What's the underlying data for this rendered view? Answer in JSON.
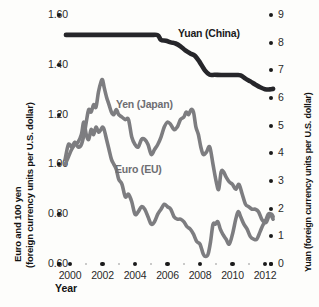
{
  "chart_data": {
    "type": "line",
    "title": "",
    "xlabel": "Year",
    "ylabel_left_line1": "Euro and 100 yen",
    "ylabel_left_line2": "(foreign currency units per U.S. dollar)",
    "ylabel_right": "Yuan (foreign currency units per U.S. dollar)",
    "xlim": [
      1999.3,
      2012.6
    ],
    "xticks": [
      2000,
      2002,
      2004,
      2006,
      2008,
      2010,
      2012
    ],
    "xticklabels": [
      "2000",
      "2002",
      "2004",
      "2006",
      "2008",
      "2010",
      "2012"
    ],
    "xminor": [
      2001,
      2003,
      2005,
      2007,
      2009,
      2011
    ],
    "ylim_left": [
      0.6,
      1.6
    ],
    "yticks_left": [
      1.6,
      1.4,
      1.2,
      1.0,
      0.8,
      0.6
    ],
    "yticklabels_left": [
      "1.60",
      "1.40",
      "1.20",
      "1.00",
      "0.80",
      "0.60"
    ],
    "ylim_right": [
      0,
      9
    ],
    "yticks_right": [
      9,
      8,
      7,
      6,
      5,
      4,
      3,
      2,
      1,
      0
    ],
    "yticklabels_right": [
      "9",
      "8",
      "7",
      "6",
      "5",
      "4",
      "3",
      "2",
      "1",
      "0"
    ],
    "grid": false,
    "legend_position": "inline-annotations",
    "colors": {
      "yuan": "#26262a",
      "yen": "#7d7d80",
      "euro": "#7d7d80",
      "tick": "#1a1a1a",
      "minor_tick": "#b9b9b9",
      "background": "#fdfdfb"
    },
    "series": [
      {
        "name": "Yuan (China)",
        "axis": "right",
        "color": "#26262a",
        "label_x": 2006.1,
        "label_y": 8.1,
        "points": [
          [
            1999.75,
            8.28
          ],
          [
            2000.5,
            8.28
          ],
          [
            2001.5,
            8.28
          ],
          [
            2002.5,
            8.28
          ],
          [
            2003.5,
            8.28
          ],
          [
            2004.5,
            8.28
          ],
          [
            2005.0,
            8.28
          ],
          [
            2005.4,
            8.27
          ],
          [
            2005.6,
            8.1
          ],
          [
            2005.9,
            8.07
          ],
          [
            2006.2,
            8.01
          ],
          [
            2006.5,
            7.97
          ],
          [
            2006.8,
            7.87
          ],
          [
            2007.1,
            7.72
          ],
          [
            2007.4,
            7.61
          ],
          [
            2007.7,
            7.52
          ],
          [
            2008.0,
            7.28
          ],
          [
            2008.3,
            7.0
          ],
          [
            2008.6,
            6.84
          ],
          [
            2008.9,
            6.84
          ],
          [
            2009.3,
            6.83
          ],
          [
            2009.8,
            6.83
          ],
          [
            2010.2,
            6.83
          ],
          [
            2010.5,
            6.82
          ],
          [
            2010.8,
            6.7
          ],
          [
            2011.1,
            6.6
          ],
          [
            2011.4,
            6.49
          ],
          [
            2011.7,
            6.39
          ],
          [
            2012.0,
            6.32
          ],
          [
            2012.3,
            6.31
          ],
          [
            2012.5,
            6.33
          ]
        ]
      },
      {
        "name": "Yen (Japan)",
        "axis": "left",
        "unit": "100 yen per U.S. dollar",
        "color": "#7d7d80",
        "label_x": 2002.9,
        "label_y": 1.24,
        "points": [
          [
            1999.7,
            1.02
          ],
          [
            1999.9,
            1.08
          ],
          [
            2000.1,
            1.07
          ],
          [
            2000.3,
            1.09
          ],
          [
            2000.5,
            1.07
          ],
          [
            2000.7,
            1.08
          ],
          [
            2000.9,
            1.13
          ],
          [
            2001.0,
            1.17
          ],
          [
            2001.15,
            1.22
          ],
          [
            2001.3,
            1.21
          ],
          [
            2001.45,
            1.24
          ],
          [
            2001.6,
            1.23
          ],
          [
            2001.75,
            1.29
          ],
          [
            2001.9,
            1.33
          ],
          [
            2002.0,
            1.34
          ],
          [
            2002.1,
            1.31
          ],
          [
            2002.25,
            1.27
          ],
          [
            2002.4,
            1.24
          ],
          [
            2002.55,
            1.21
          ],
          [
            2002.7,
            1.2
          ],
          [
            2002.85,
            1.22
          ],
          [
            2003.0,
            1.2
          ],
          [
            2003.2,
            1.19
          ],
          [
            2003.4,
            1.18
          ],
          [
            2003.6,
            1.18
          ],
          [
            2003.8,
            1.11
          ],
          [
            2004.0,
            1.08
          ],
          [
            2004.2,
            1.07
          ],
          [
            2004.4,
            1.1
          ],
          [
            2004.6,
            1.1
          ],
          [
            2004.8,
            1.08
          ],
          [
            2005.0,
            1.04
          ],
          [
            2005.2,
            1.06
          ],
          [
            2005.4,
            1.08
          ],
          [
            2005.6,
            1.11
          ],
          [
            2005.8,
            1.15
          ],
          [
            2006.0,
            1.17
          ],
          [
            2006.2,
            1.16
          ],
          [
            2006.4,
            1.14
          ],
          [
            2006.6,
            1.15
          ],
          [
            2006.8,
            1.18
          ],
          [
            2007.0,
            1.19
          ],
          [
            2007.15,
            1.21
          ],
          [
            2007.3,
            1.2
          ],
          [
            2007.45,
            1.22
          ],
          [
            2007.6,
            1.21
          ],
          [
            2007.75,
            1.15
          ],
          [
            2007.9,
            1.12
          ],
          [
            2008.05,
            1.07
          ],
          [
            2008.2,
            1.04
          ],
          [
            2008.4,
            1.05
          ],
          [
            2008.6,
            1.07
          ],
          [
            2008.8,
            1.0
          ],
          [
            2009.0,
            0.93
          ],
          [
            2009.15,
            0.9
          ],
          [
            2009.3,
            0.97
          ],
          [
            2009.45,
            0.97
          ],
          [
            2009.6,
            0.95
          ],
          [
            2009.8,
            0.93
          ],
          [
            2010.0,
            0.92
          ],
          [
            2010.2,
            0.9
          ],
          [
            2010.4,
            0.92
          ],
          [
            2010.6,
            0.88
          ],
          [
            2010.8,
            0.84
          ],
          [
            2011.0,
            0.83
          ],
          [
            2011.2,
            0.82
          ],
          [
            2011.4,
            0.82
          ],
          [
            2011.6,
            0.81
          ],
          [
            2011.8,
            0.78
          ],
          [
            2012.0,
            0.77
          ],
          [
            2012.2,
            0.8
          ],
          [
            2012.4,
            0.8
          ],
          [
            2012.5,
            0.79
          ]
        ]
      },
      {
        "name": "Euro (EU)",
        "axis": "left",
        "unit": "euros per U.S. dollar",
        "color": "#7d7d80",
        "label_x": 2002.85,
        "label_y": 0.97,
        "points": [
          [
            1999.7,
            1.0
          ],
          [
            1999.9,
            1.03
          ],
          [
            2000.1,
            1.06
          ],
          [
            2000.3,
            1.08
          ],
          [
            2000.5,
            1.09
          ],
          [
            2000.7,
            1.12
          ],
          [
            2000.85,
            1.17
          ],
          [
            2001.0,
            1.12
          ],
          [
            2001.15,
            1.1
          ],
          [
            2001.3,
            1.14
          ],
          [
            2001.45,
            1.12
          ],
          [
            2001.6,
            1.15
          ],
          [
            2001.75,
            1.13
          ],
          [
            2001.9,
            1.14
          ],
          [
            2002.0,
            1.15
          ],
          [
            2002.1,
            1.14
          ],
          [
            2002.25,
            1.1
          ],
          [
            2002.4,
            1.06
          ],
          [
            2002.55,
            1.02
          ],
          [
            2002.7,
            1.0
          ],
          [
            2002.85,
            0.98
          ],
          [
            2003.0,
            0.94
          ],
          [
            2003.2,
            0.92
          ],
          [
            2003.4,
            0.87
          ],
          [
            2003.6,
            0.88
          ],
          [
            2003.8,
            0.85
          ],
          [
            2004.0,
            0.8
          ],
          [
            2004.2,
            0.81
          ],
          [
            2004.4,
            0.83
          ],
          [
            2004.6,
            0.82
          ],
          [
            2004.8,
            0.79
          ],
          [
            2005.0,
            0.76
          ],
          [
            2005.2,
            0.77
          ],
          [
            2005.4,
            0.8
          ],
          [
            2005.6,
            0.82
          ],
          [
            2005.8,
            0.84
          ],
          [
            2006.0,
            0.83
          ],
          [
            2006.2,
            0.82
          ],
          [
            2006.4,
            0.79
          ],
          [
            2006.6,
            0.78
          ],
          [
            2006.8,
            0.78
          ],
          [
            2007.0,
            0.77
          ],
          [
            2007.2,
            0.75
          ],
          [
            2007.4,
            0.74
          ],
          [
            2007.6,
            0.72
          ],
          [
            2007.8,
            0.69
          ],
          [
            2008.0,
            0.68
          ],
          [
            2008.2,
            0.64
          ],
          [
            2008.35,
            0.63
          ],
          [
            2008.5,
            0.64
          ],
          [
            2008.65,
            0.69
          ],
          [
            2008.8,
            0.76
          ],
          [
            2008.95,
            0.76
          ],
          [
            2009.1,
            0.77
          ],
          [
            2009.25,
            0.74
          ],
          [
            2009.4,
            0.72
          ],
          [
            2009.6,
            0.7
          ],
          [
            2009.8,
            0.68
          ],
          [
            2010.0,
            0.72
          ],
          [
            2010.2,
            0.78
          ],
          [
            2010.35,
            0.81
          ],
          [
            2010.5,
            0.79
          ],
          [
            2010.7,
            0.76
          ],
          [
            2010.9,
            0.74
          ],
          [
            2011.1,
            0.71
          ],
          [
            2011.3,
            0.7
          ],
          [
            2011.5,
            0.7
          ],
          [
            2011.7,
            0.73
          ],
          [
            2011.9,
            0.76
          ],
          [
            2012.1,
            0.77
          ],
          [
            2012.3,
            0.8
          ],
          [
            2012.5,
            0.78
          ]
        ]
      }
    ]
  }
}
